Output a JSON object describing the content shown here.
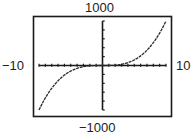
{
  "chart_data": {
    "type": "line",
    "title": "",
    "function": "y = x^3",
    "xlabel": "",
    "ylabel": "",
    "xlim": [
      -10,
      10
    ],
    "ylim": [
      -1000,
      1000
    ],
    "x_tick_step": 1,
    "y_tick_step": 200,
    "grid": false,
    "window_labels": {
      "xmin": "−10",
      "xmax": "10",
      "ymin": "−1000",
      "ymax": "1000"
    },
    "series": [
      {
        "name": "f(x)",
        "x": [
          -10,
          -9,
          -8,
          -7,
          -6,
          -5,
          -4,
          -3,
          -2,
          -1,
          0,
          1,
          2,
          3,
          4,
          5,
          6,
          7,
          8,
          9,
          10
        ],
        "values": [
          -1000,
          -729,
          -512,
          -343,
          -216,
          -125,
          -64,
          -27,
          -8,
          -1,
          0,
          1,
          8,
          27,
          64,
          125,
          216,
          343,
          512,
          729,
          1000
        ]
      }
    ]
  },
  "colors": {
    "frame": "#1a1a1a",
    "axis": "#1a1a1a",
    "curve": "#2a2a2a",
    "background": "#ffffff"
  }
}
